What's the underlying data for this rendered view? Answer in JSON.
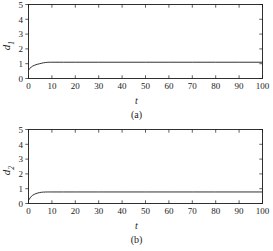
{
  "figure": {
    "background": "#ffffff",
    "ink": "#1b1b1b",
    "panels": [
      {
        "caption": "(a)",
        "ylabel_base": "d",
        "ylabel_sub": "1",
        "xlabel": "t"
      },
      {
        "caption": "(b)",
        "ylabel_base": "d",
        "ylabel_sub": "2",
        "xlabel": "t"
      }
    ]
  },
  "chart_data": [
    {
      "type": "line",
      "title": "",
      "caption": "(a)",
      "xlabel": "t",
      "ylabel": "d_1",
      "xlim": [
        0,
        100
      ],
      "ylim": [
        0,
        5
      ],
      "xticks": [
        0,
        10,
        20,
        30,
        40,
        50,
        60,
        70,
        80,
        90,
        100
      ],
      "yticks": [
        0,
        1,
        2,
        3,
        4,
        5
      ],
      "xticklabels": [
        "0",
        "10",
        "20",
        "30",
        "40",
        "50",
        "60",
        "70",
        "80",
        "90",
        "100"
      ],
      "yticklabels": [
        "0",
        "1",
        "2",
        "3",
        "4",
        "5"
      ],
      "grid": false,
      "legend": false,
      "line_color": "#1b1b1b",
      "series": [
        {
          "name": "d1",
          "x": [
            0,
            0.3,
            0.7,
            1.2,
            1.8,
            2.5,
            3.2,
            4.0,
            4.8,
            5.6,
            6.4,
            7.2,
            8.0,
            9.0,
            10,
            15,
            20,
            30,
            40,
            50,
            60,
            70,
            80,
            90,
            100
          ],
          "y": [
            0.57,
            0.62,
            0.7,
            0.78,
            0.84,
            0.89,
            0.93,
            0.97,
            1.0,
            1.03,
            1.06,
            1.08,
            1.09,
            1.1,
            1.1,
            1.1,
            1.1,
            1.1,
            1.1,
            1.1,
            1.1,
            1.1,
            1.1,
            1.1,
            1.1
          ]
        }
      ],
      "steady_state": 1.1,
      "initial_value": 0.57
    },
    {
      "type": "line",
      "title": "",
      "caption": "(b)",
      "xlabel": "t",
      "ylabel": "d_2",
      "xlim": [
        0,
        100
      ],
      "ylim": [
        0,
        5
      ],
      "xticks": [
        0,
        10,
        20,
        30,
        40,
        50,
        60,
        70,
        80,
        90,
        100
      ],
      "yticks": [
        0,
        1,
        2,
        3,
        4,
        5
      ],
      "xticklabels": [
        "0",
        "10",
        "20",
        "30",
        "40",
        "50",
        "60",
        "70",
        "80",
        "90",
        "100"
      ],
      "yticklabels": [
        "0",
        "1",
        "2",
        "3",
        "4",
        "5"
      ],
      "grid": false,
      "legend": false,
      "line_color": "#1b1b1b",
      "series": [
        {
          "name": "d2",
          "x": [
            0,
            0.3,
            0.7,
            1.2,
            1.8,
            2.5,
            3.2,
            4.0,
            4.8,
            5.6,
            6.4,
            7.2,
            8.0,
            9.0,
            10,
            15,
            20,
            30,
            40,
            50,
            60,
            70,
            80,
            90,
            100
          ],
          "y": [
            0.2,
            0.28,
            0.38,
            0.48,
            0.56,
            0.62,
            0.67,
            0.71,
            0.74,
            0.76,
            0.77,
            0.775,
            0.78,
            0.78,
            0.78,
            0.78,
            0.78,
            0.78,
            0.78,
            0.78,
            0.78,
            0.78,
            0.78,
            0.78,
            0.78
          ]
        }
      ],
      "steady_state": 0.78,
      "initial_value": 0.2
    }
  ]
}
